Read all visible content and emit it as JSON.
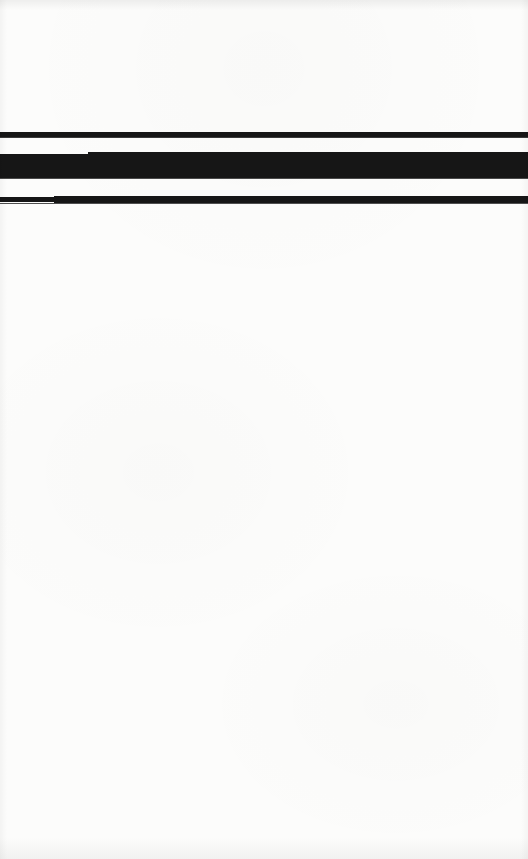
{
  "page": {
    "kind": "scanned-document-page",
    "width": 528,
    "height": 859,
    "background_color": "#fcfcfb",
    "ink_color": "#161616",
    "visible_text": "",
    "alt_text": ""
  },
  "marks": {
    "bars": [
      {
        "name": "top-rule-bar",
        "label": "",
        "x": 0,
        "y": 132,
        "width": 528,
        "height": 6,
        "color": "#161616"
      },
      {
        "name": "redaction-block-bar",
        "label": "",
        "x": 0,
        "y": 152,
        "width": 528,
        "height": 26,
        "color": "#161616"
      },
      {
        "name": "bottom-rule-bar",
        "label": "",
        "x": 0,
        "y": 196,
        "width": 528,
        "height": 7,
        "color": "#161616"
      }
    ]
  },
  "regions": {
    "header_blank": {
      "name": "upper-blank-area",
      "text": ""
    },
    "body_blank": {
      "name": "lower-blank-area",
      "text": ""
    }
  }
}
